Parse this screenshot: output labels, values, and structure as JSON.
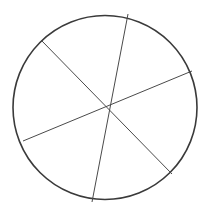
{
  "figure": {
    "name": "circle-six-sectors",
    "canvas": {
      "width": 210,
      "height": 216,
      "background_color": "#ffffff"
    },
    "colors": {
      "circle_stroke": "#3a3a3a",
      "chord_stroke": "#4a4a4a",
      "fill": "#ffffff"
    },
    "circle": {
      "label": "circle-outline",
      "center_x": 105,
      "center_y": 107.5,
      "radius": 92,
      "stroke_width": 1.6
    },
    "chords": [
      {
        "label": "chord-vertical",
        "x1": 128,
        "y1": 14,
        "x2": 92,
        "y2": 202,
        "stroke_width": 1.0
      },
      {
        "label": "chord-northwest-southeast",
        "x1": 41,
        "y1": 40,
        "x2": 172,
        "y2": 174,
        "stroke_width": 1.0
      },
      {
        "label": "chord-west-east",
        "x1": 23,
        "y1": 141,
        "x2": 192,
        "y2": 71,
        "stroke_width": 1.0
      }
    ],
    "center_point": {
      "label": "chord-intersection",
      "x": 106,
      "y": 108
    },
    "sector_count": 6
  },
  "chart_data": {
    "type": "pie",
    "categories": [
      "Sector 1",
      "Sector 2",
      "Sector 3",
      "Sector 4",
      "Sector 5",
      "Sector 6"
    ],
    "values": [
      57,
      45,
      78,
      57,
      45,
      78
    ],
    "unit": "degrees",
    "labels_shown": false,
    "legend": "none",
    "grid": false
  }
}
